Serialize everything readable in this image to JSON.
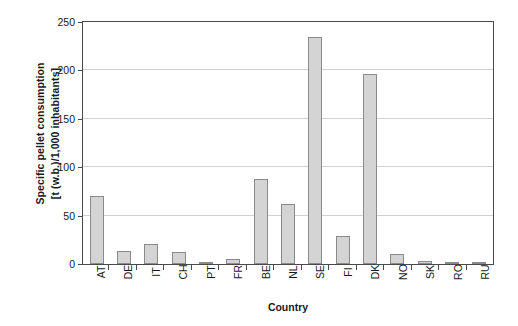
{
  "chart_data": {
    "type": "bar",
    "title": "",
    "xlabel": "Country",
    "ylabel_line1": "Specific pellet consumption",
    "ylabel_line2": "[t (w.b.)/1,000 inhabitants]",
    "categories": [
      "AT",
      "DE",
      "IT",
      "CH",
      "PT",
      "FR",
      "BE",
      "NL",
      "SE",
      "FI",
      "DK",
      "NO",
      "SK",
      "RO",
      "RU"
    ],
    "values": [
      70,
      13,
      21,
      12,
      1,
      5.5,
      87,
      61,
      233,
      29,
      195,
      10,
      3.5,
      1.5,
      0.5
    ],
    "ylim": [
      0,
      250
    ],
    "yticks": [
      0,
      50,
      100,
      150,
      200,
      250
    ],
    "ytick_labels": [
      "0",
      "50",
      "100",
      "150",
      "200",
      "250"
    ],
    "grid": "horizontal",
    "legend": "none",
    "bar_fill_color": "#d4d4d4",
    "bar_border_color": "#8a8a8a",
    "gridline_color": "#d0d0d0",
    "axis_color": "#4a4a4a"
  }
}
